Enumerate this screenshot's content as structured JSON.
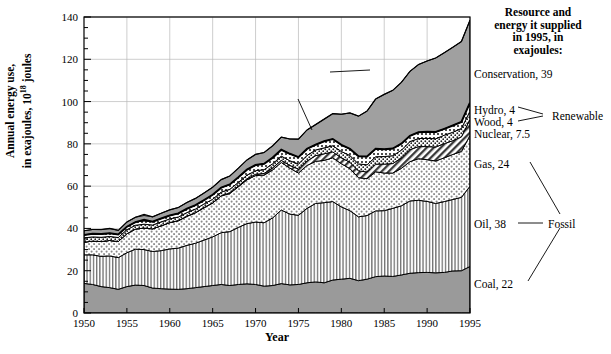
{
  "axes": {
    "ylabel_line1": "Annual energy use,",
    "ylabel_line2": "in exajoules, 10",
    "ylabel_exp": "18",
    "ylabel_line2b": " joules",
    "xlabel": "Year",
    "yticks": [
      0,
      20,
      40,
      60,
      80,
      100,
      120,
      140
    ],
    "xticks": [
      1950,
      1955,
      1960,
      1965,
      1970,
      1975,
      1980,
      1985,
      1990,
      1995
    ]
  },
  "annotations": {
    "gnp_line1": "U.S. annual inflation-adjusted",
    "gnp_line2": "GNP, appropriately scaled",
    "total_energy": "Total annual energy",
    "conservation": "Conservation",
    "gas": "Gas",
    "oil": "Oil",
    "coal": "Coal"
  },
  "right_panel": {
    "title_line1": "Resource and",
    "title_line2": "energy it supplied",
    "title_line3": "in 1995, in",
    "title_line4": "exajoules:",
    "items": [
      {
        "label": "Conservation, 39"
      },
      {
        "label": "Hydro, 4"
      },
      {
        "label": "Wood, 4"
      },
      {
        "label": "Nuclear, 7.5"
      },
      {
        "label": "Gas, 24"
      },
      {
        "label": "Oil, 38"
      },
      {
        "label": "Coal, 22"
      }
    ],
    "group_renewable": "Renewable",
    "group_fossil": "Fossil"
  },
  "colors": {
    "coal_fill": "#9a9a9a",
    "conservation_fill": "#a0a0a0",
    "grid": "#b8b8b8",
    "axis": "#000000",
    "plot_bg": "#ffffff"
  },
  "chart_data": {
    "type": "area",
    "title": "",
    "xlabel": "Year",
    "ylabel": "Annual energy use, in exajoules, 10^18 joules",
    "xlim": [
      1950,
      1995
    ],
    "ylim": [
      0,
      140
    ],
    "grid": true,
    "legend": "right-side callouts",
    "stacked": true,
    "x": [
      1950,
      1951,
      1952,
      1953,
      1954,
      1955,
      1956,
      1957,
      1958,
      1959,
      1960,
      1961,
      1962,
      1963,
      1964,
      1965,
      1966,
      1967,
      1968,
      1969,
      1970,
      1971,
      1972,
      1973,
      1974,
      1975,
      1976,
      1977,
      1978,
      1979,
      1980,
      1981,
      1982,
      1983,
      1984,
      1985,
      1986,
      1987,
      1988,
      1989,
      1990,
      1991,
      1992,
      1993,
      1994,
      1995
    ],
    "series": [
      {
        "name": "Coal",
        "values": [
          14.0,
          13.5,
          12.5,
          12.0,
          11.2,
          12.5,
          13.2,
          13.0,
          11.8,
          11.5,
          11.3,
          11.2,
          11.5,
          12.0,
          12.5,
          13.0,
          13.5,
          13.0,
          13.5,
          13.8,
          13.5,
          12.7,
          13.0,
          13.9,
          13.3,
          13.5,
          14.3,
          14.7,
          14.3,
          15.6,
          16.0,
          16.4,
          15.3,
          16.0,
          17.2,
          17.5,
          17.3,
          18.0,
          18.8,
          19.1,
          19.2,
          19.0,
          19.2,
          19.9,
          20.0,
          22.0
        ]
      },
      {
        "name": "Oil",
        "values": [
          13.5,
          14.0,
          14.3,
          15.0,
          15.0,
          16.0,
          17.0,
          17.0,
          17.3,
          18.0,
          19.0,
          19.5,
          20.5,
          21.0,
          22.0,
          23.0,
          24.5,
          25.5,
          27.0,
          28.5,
          29.5,
          30.0,
          32.0,
          34.8,
          33.5,
          32.7,
          35.2,
          37.1,
          37.9,
          37.1,
          34.2,
          32.0,
          30.2,
          30.1,
          31.1,
          30.9,
          32.2,
          32.7,
          34.2,
          34.2,
          33.6,
          32.8,
          33.5,
          33.8,
          34.7,
          38.0
        ]
      },
      {
        "name": "Gas",
        "values": [
          6.0,
          6.5,
          7.0,
          7.3,
          7.6,
          9.0,
          9.5,
          10.2,
          10.7,
          11.7,
          12.4,
          12.9,
          13.7,
          14.4,
          15.3,
          16.0,
          17.4,
          18.0,
          19.2,
          20.7,
          22.0,
          22.5,
          22.7,
          22.5,
          21.7,
          20.0,
          20.3,
          19.9,
          20.0,
          20.7,
          20.4,
          19.9,
          18.5,
          17.4,
          18.5,
          17.8,
          16.7,
          17.7,
          18.6,
          19.7,
          19.7,
          20.1,
          20.7,
          21.3,
          21.7,
          24.0
        ]
      },
      {
        "name": "Nuclear",
        "values": [
          0.0,
          0.0,
          0.0,
          0.0,
          0.0,
          0.0,
          0.0,
          0.0,
          0.0,
          0.1,
          0.1,
          0.1,
          0.1,
          0.1,
          0.1,
          0.1,
          0.1,
          0.3,
          0.4,
          0.5,
          0.6,
          0.8,
          1.0,
          1.0,
          1.3,
          1.9,
          2.1,
          2.7,
          3.1,
          2.8,
          2.8,
          3.0,
          3.2,
          3.2,
          3.6,
          4.2,
          4.5,
          4.9,
          5.7,
          5.7,
          6.2,
          6.6,
          6.7,
          6.5,
          6.9,
          7.5
        ]
      },
      {
        "name": "Wood",
        "values": [
          2.0,
          2.0,
          2.0,
          1.9,
          1.9,
          1.9,
          1.8,
          1.8,
          1.8,
          1.8,
          1.7,
          1.7,
          1.7,
          1.7,
          1.7,
          1.7,
          1.7,
          1.7,
          1.7,
          1.7,
          1.7,
          1.8,
          1.9,
          2.0,
          2.2,
          2.4,
          2.6,
          2.7,
          2.8,
          2.9,
          3.0,
          3.2,
          3.3,
          3.4,
          3.5,
          3.6,
          3.7,
          3.7,
          3.8,
          3.8,
          3.9,
          3.9,
          4.0,
          4.0,
          4.0,
          4.0
        ]
      },
      {
        "name": "Hydro",
        "values": [
          1.4,
          1.5,
          1.5,
          1.5,
          1.4,
          1.4,
          1.5,
          1.6,
          1.6,
          1.6,
          1.6,
          1.7,
          1.8,
          1.8,
          1.8,
          2.1,
          2.1,
          2.3,
          2.4,
          2.6,
          2.7,
          2.8,
          2.9,
          3.0,
          3.3,
          3.2,
          3.1,
          2.5,
          3.1,
          3.2,
          3.1,
          3.1,
          3.6,
          3.9,
          3.8,
          3.4,
          3.4,
          3.1,
          2.7,
          3.0,
          3.1,
          3.2,
          3.0,
          3.2,
          3.1,
          4.0
        ]
      },
      {
        "name": "Conservation",
        "values": [
          2.0,
          2.0,
          2.1,
          2.2,
          2.0,
          2.2,
          2.3,
          2.5,
          2.3,
          2.5,
          2.7,
          2.8,
          3.0,
          3.2,
          3.4,
          3.6,
          3.8,
          4.0,
          4.3,
          4.6,
          5.0,
          5.3,
          5.6,
          6.0,
          7.0,
          8.5,
          9.0,
          9.5,
          10.5,
          12.0,
          14.5,
          17.0,
          19.0,
          21.5,
          23.5,
          26.0,
          27.5,
          29.0,
          30.5,
          32.0,
          33.5,
          35.0,
          36.0,
          37.0,
          38.0,
          39.0
        ]
      }
    ],
    "lines": [
      {
        "name": "Total annual energy",
        "values": [
          36.9,
          37.5,
          37.4,
          37.7,
          37.1,
          40.8,
          43.0,
          44.1,
          43.2,
          44.7,
          46.1,
          47.1,
          49.3,
          51.0,
          53.4,
          55.9,
          59.3,
          60.8,
          64.2,
          67.8,
          70.0,
          70.6,
          73.5,
          77.2,
          75.3,
          73.7,
          77.6,
          79.6,
          81.2,
          82.3,
          79.5,
          77.6,
          74.1,
          74.0,
          77.7,
          77.4,
          77.8,
          80.1,
          83.8,
          85.5,
          85.7,
          85.6,
          87.1,
          88.7,
          90.4,
          99.5
        ]
      },
      {
        "name": "GNP scaled",
        "values": [
          38.9,
          39.5,
          39.5,
          40.0,
          39.1,
          43.0,
          45.3,
          46.6,
          45.5,
          47.2,
          48.8,
          49.9,
          52.3,
          54.2,
          56.8,
          59.5,
          63.1,
          64.8,
          68.5,
          72.4,
          75.0,
          75.9,
          79.1,
          83.2,
          82.3,
          82.2,
          86.6,
          89.1,
          91.7,
          94.3,
          94.0,
          94.6,
          93.1,
          95.5,
          101.2,
          103.4,
          105.3,
          109.1,
          114.3,
          117.5,
          119.2,
          120.6,
          123.1,
          125.7,
          128.4,
          138.5
        ]
      }
    ]
  }
}
